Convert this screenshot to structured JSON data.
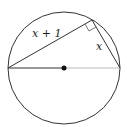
{
  "diagram": {
    "type": "geometry",
    "labels": {
      "long_leg": "x + 1",
      "short_leg": "x"
    },
    "colors": {
      "stroke": "#333333",
      "radius_light": "#bbbbbb",
      "center_dot": "#111111"
    }
  }
}
